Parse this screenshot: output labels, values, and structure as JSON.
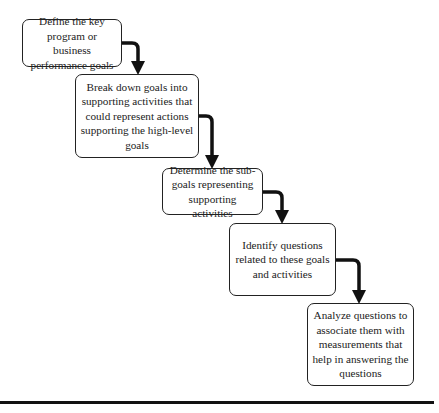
{
  "diagram": {
    "type": "staircase-flow",
    "steps": [
      {
        "id": 1,
        "text": "Define the key\nprogram or business\nperformance goals"
      },
      {
        "id": 2,
        "text": "Break down goals into\nsupporting activities that\ncould represent actions\nsupporting the high-level\ngoals"
      },
      {
        "id": 3,
        "text": "Determine the sub-\ngoals representing\nsupporting activities"
      },
      {
        "id": 4,
        "text": "Identify questions\nrelated to these goals\nand activities"
      },
      {
        "id": 5,
        "text": "Analyze questions to\nassociate them with\nmeasurements that\nhelp in answering the\nquestions"
      }
    ],
    "connectors": [
      {
        "from": 1,
        "to": 2
      },
      {
        "from": 2,
        "to": 3
      },
      {
        "from": 3,
        "to": 4
      },
      {
        "from": 4,
        "to": 5
      }
    ],
    "colors": {
      "stroke": "#111111",
      "background": "#ffffff",
      "text": "#222222"
    }
  }
}
